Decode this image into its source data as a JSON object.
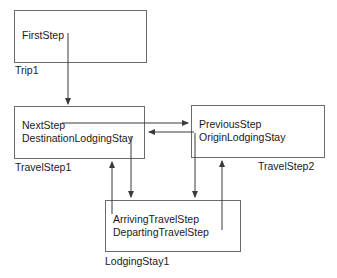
{
  "diagram": {
    "type": "uml-object-diagram",
    "line_color": "#6b6b6b",
    "arrow_color": "#3a3a3a",
    "text_color": "#1a1a1a",
    "background": "#ffffff",
    "objects": [
      {
        "id": "trip1",
        "instance_label": "Trip1",
        "slots": [
          "FirstStep"
        ]
      },
      {
        "id": "travelstep1",
        "instance_label": "TravelStep1",
        "slots": [
          "NextStep",
          "DestinationLodgingStay"
        ]
      },
      {
        "id": "travelstep2",
        "instance_label": "TravelStep2",
        "slots": [
          "PreviousStep",
          "OriginLodgingStay"
        ]
      },
      {
        "id": "lodgingstay1",
        "instance_label": "LodgingStay1",
        "slots": [
          "ArrivingTravelStep",
          "DepartingTravelStep"
        ]
      }
    ],
    "links": [
      {
        "from": "trip1.FirstStep",
        "to": "travelstep1",
        "direction": "down"
      },
      {
        "from": "travelstep1.NextStep",
        "to": "travelstep2",
        "direction": "right"
      },
      {
        "from": "travelstep2.PreviousStep",
        "to": "travelstep1",
        "direction": "left"
      },
      {
        "from": "travelstep1.DestinationLodgingStay",
        "to": "lodgingstay1",
        "direction": "down"
      },
      {
        "from": "lodgingstay1.ArrivingTravelStep",
        "to": "travelstep1",
        "direction": "up"
      },
      {
        "from": "travelstep2.OriginLodgingStay",
        "to": "lodgingstay1",
        "direction": "down"
      },
      {
        "from": "lodgingstay1.DepartingTravelStep",
        "to": "travelstep2",
        "direction": "up"
      }
    ]
  }
}
